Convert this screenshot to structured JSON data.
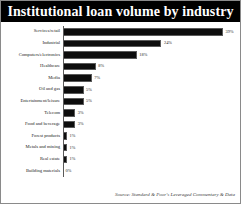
{
  "chart_data": {
    "type": "bar",
    "orientation": "horizontal",
    "title": "Institutional loan volume by industry",
    "xlabel": "",
    "ylabel": "",
    "xlim": [
      0,
      39
    ],
    "grid": false,
    "legend": null,
    "value_suffix": "%",
    "source": "Source: Standard & Poor's Leveraged Commentary & Data",
    "categories": [
      "Services/retail",
      "Industrial",
      "Computers/electronics",
      "Healthcare",
      "Media",
      "Oil and gas",
      "Entertainment/leisure",
      "Telecom",
      "Food and beverage",
      "Forest products",
      "Metals and mining",
      "Real estate",
      "Building materials"
    ],
    "values": [
      39,
      24,
      18,
      8,
      7,
      5,
      5,
      3,
      3,
      1,
      1,
      1,
      0
    ],
    "labels": [
      "39%",
      "24%",
      "18%",
      "8%",
      "7%",
      "5%",
      "5%",
      "3%",
      "3%",
      "1%",
      "1%",
      "1%",
      "0%"
    ],
    "bar_color": "#0d0d0d",
    "title_background": "#000000",
    "title_color": "#ffffff",
    "background": "#ffffff"
  }
}
